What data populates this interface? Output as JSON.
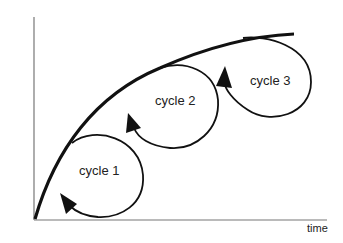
{
  "diagram": {
    "type": "improvement-cycles",
    "axes": {
      "y_label": "quality improvement",
      "x_label": "time"
    },
    "curve": "concave increasing improvement curve from origin",
    "cycles": [
      {
        "label": "cycle 1"
      },
      {
        "label": "cycle 2"
      },
      {
        "label": "cycle 3"
      }
    ],
    "colors": {
      "stroke": "#111111",
      "axis": "#777777",
      "text": "#222222",
      "background": "#ffffff"
    }
  }
}
